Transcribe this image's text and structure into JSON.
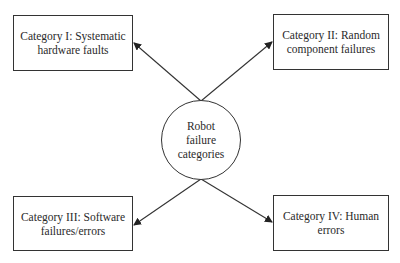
{
  "diagram": {
    "center": {
      "label_lines": [
        "Robot",
        "failure",
        "categories"
      ]
    },
    "categories": [
      {
        "label_lines": [
          "Category I: Systematic",
          "hardware faults"
        ]
      },
      {
        "label_lines": [
          "Category II: Random",
          "component failures"
        ]
      },
      {
        "label_lines": [
          "Category III: Software",
          "failures/errors"
        ]
      },
      {
        "label_lines": [
          "Category IV: Human",
          "errors"
        ]
      }
    ],
    "colors": {
      "stroke": "#333333",
      "text": "#2a2a2a",
      "background": "#ffffff"
    }
  }
}
